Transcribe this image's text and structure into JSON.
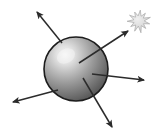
{
  "figure": {
    "title": "Sphere emitting radiating arrows toward a starburst",
    "canvas": {
      "width": 156,
      "height": 136,
      "background": "#ffffff"
    },
    "colors": {
      "background": "#ffffff",
      "sphere_outline": "#1c1c1c",
      "sphere_highlight": "#f2f2f2",
      "sphere_midtone": "#9a9a9a",
      "sphere_shadow": "#3a3a3a",
      "arrow_stroke": "#2b2b2b",
      "starburst_fill": "#d6d6d6",
      "starburst_stroke": "#9c9c9c"
    },
    "sphere": {
      "label": "sphere",
      "center_x": 76,
      "center_y": 69,
      "radius": 32,
      "highlight_x": 66,
      "highlight_y": 56,
      "outline_width": 1.6
    },
    "starburst": {
      "label": "starburst",
      "center_x": 139,
      "center_y": 21,
      "outer_radius": 11,
      "inner_radius": 5.2,
      "points": 11
    },
    "arrows": [
      {
        "id": "arrow-up-left",
        "label": "up-left arrow",
        "x1": 62,
        "y1": 43,
        "x2": 37,
        "y2": 12,
        "head_size": 7.5
      },
      {
        "id": "arrow-up-right",
        "label": "up-right arrow toward starburst",
        "x1": 79,
        "y1": 63,
        "x2": 128,
        "y2": 31,
        "head_size": 7.5
      },
      {
        "id": "arrow-right",
        "label": "right arrow",
        "x1": 92,
        "y1": 74,
        "x2": 144,
        "y2": 80,
        "head_size": 7.5
      },
      {
        "id": "arrow-down-right",
        "label": "down-right arrow",
        "x1": 83,
        "y1": 78,
        "x2": 112,
        "y2": 127,
        "head_size": 7.5
      },
      {
        "id": "arrow-down-left",
        "label": "down-left arrow",
        "x1": 58,
        "y1": 90,
        "x2": 13,
        "y2": 102,
        "head_size": 7.5
      }
    ]
  }
}
